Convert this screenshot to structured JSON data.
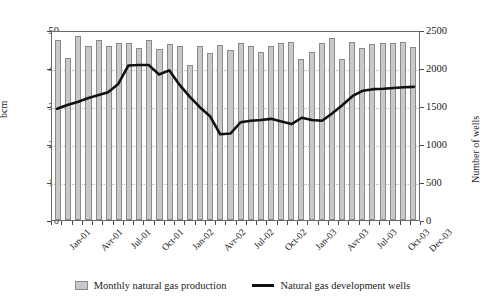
{
  "chart_data": {
    "type": "bar",
    "title": "",
    "subtitle": "",
    "xlabel": "",
    "ylabel": "bcm",
    "y2label": "Number of wells",
    "ylim": [
      0,
      50
    ],
    "y2lim": [
      0,
      2500
    ],
    "grid": true,
    "legend_position": "bottom-center",
    "categories": [
      "Jan-01",
      "Feb-01",
      "Mar-01",
      "Avr-01",
      "May-01",
      "Jun-01",
      "Jul-01",
      "Aug-01",
      "Sep-01",
      "Oct-01",
      "Nov-01",
      "Dec-01",
      "Jan-02",
      "Feb-02",
      "Mar-02",
      "Avr-02",
      "May-02",
      "Jun-02",
      "Jul-02",
      "Aug-02",
      "Sep-02",
      "Oct-02",
      "Nov-02",
      "Dec-02",
      "Jan-03",
      "Feb-03",
      "Mar-03",
      "Avr-03",
      "May-03",
      "Jun-03",
      "Jul-03",
      "Aug-03",
      "Sep-03",
      "Oct-03",
      "Nov-03",
      "Dec-03"
    ],
    "x_tick_labels": [
      {
        "index": 0,
        "label": "Jan-01"
      },
      {
        "index": 3,
        "label": "Avr-01"
      },
      {
        "index": 6,
        "label": "Jul-01"
      },
      {
        "index": 9,
        "label": "Oct-01"
      },
      {
        "index": 12,
        "label": "Jan-02"
      },
      {
        "index": 15,
        "label": "Avr-02"
      },
      {
        "index": 18,
        "label": "Jul-02"
      },
      {
        "index": 21,
        "label": "Oct-02"
      },
      {
        "index": 24,
        "label": "Jan-03"
      },
      {
        "index": 27,
        "label": "Avr-03"
      },
      {
        "index": 30,
        "label": "Jul-03"
      },
      {
        "index": 33,
        "label": "Oct-03"
      },
      {
        "index": 35,
        "label": "Dec-03"
      }
    ],
    "y_tick_labels": [
      "0",
      "10",
      "20",
      "30",
      "40",
      "50"
    ],
    "y_tick_values": [
      0,
      10,
      20,
      30,
      40,
      50
    ],
    "y2_tick_labels": [
      "0",
      "500",
      "1000",
      "1500",
      "2000",
      "2500"
    ],
    "y2_tick_values": [
      0,
      500,
      1000,
      1500,
      2000,
      2500
    ],
    "series": [
      {
        "name": "Monthly natural gas production",
        "type": "bar",
        "axis": "left",
        "unit": "bcm",
        "color": "#c9c9c9",
        "edge_color": "#8a8a8a",
        "values": [
          47.5,
          42.6,
          48.4,
          45.8,
          47.5,
          45.8,
          46.6,
          46.7,
          45.2,
          47.4,
          45.1,
          46.4,
          45.7,
          40.9,
          45.9,
          44.0,
          46.0,
          44.8,
          46.6,
          45.8,
          44.2,
          45.8,
          46.5,
          46.8,
          42.5,
          44.2,
          46.5,
          47.9,
          42.5,
          46.9,
          45.3,
          46.4,
          46.5,
          46.5,
          46.8,
          45.5
        ]
      },
      {
        "name": "Natural gas development wells",
        "type": "line",
        "axis": "right",
        "unit": "wells",
        "color": "#111111",
        "values": [
          1480,
          1530,
          1570,
          1620,
          1660,
          1700,
          1810,
          2055,
          2060,
          2060,
          1935,
          1990,
          1800,
          1640,
          1500,
          1380,
          1140,
          1150,
          1300,
          1320,
          1330,
          1345,
          1310,
          1275,
          1360,
          1330,
          1320,
          1420,
          1530,
          1650,
          1720,
          1740,
          1745,
          1755,
          1765,
          1770
        ]
      }
    ]
  },
  "legend": {
    "items": [
      {
        "label": "Monthly natural gas production",
        "marker": "bar-swatch"
      },
      {
        "label": "Natural gas development wells",
        "marker": "line-swatch"
      }
    ]
  },
  "axes": {
    "left_title": "bcm",
    "right_title": "Number of wells"
  },
  "colors": {
    "bar_fill": "#c9c9c9",
    "bar_edge": "#8a8a8a",
    "line": "#111111",
    "grid": "#b8b8b8",
    "frame": "#6b6b6b",
    "background": "#ffffff"
  }
}
